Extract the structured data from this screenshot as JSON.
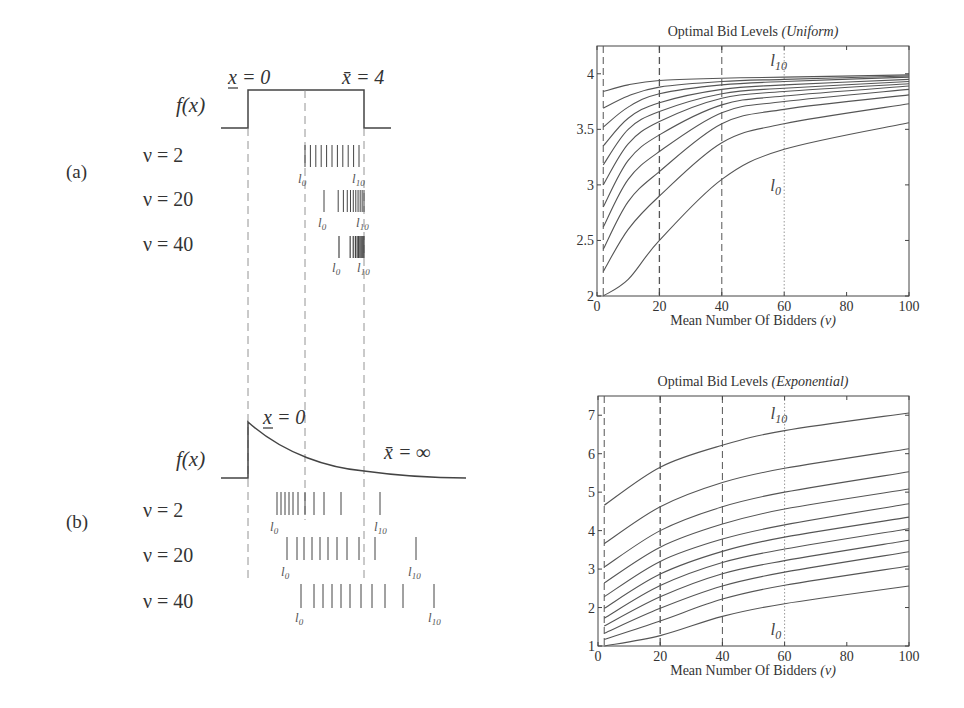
{
  "left_panel": {
    "panel_a": {
      "label": "(a)",
      "f_label": "f(x)",
      "x_low_label": "x = 0",
      "x_high_label": "x̄ = 4",
      "rows": [
        {
          "label": "ν = 2",
          "l0": "l0",
          "l10": "l10"
        },
        {
          "label": "ν = 20",
          "l0": "l0",
          "l10": "l10"
        },
        {
          "label": "ν = 40",
          "l0": "l0",
          "l10": "l10"
        }
      ]
    },
    "panel_b": {
      "label": "(b)",
      "f_label": "f(x)",
      "x_low_label": "x = 0",
      "x_high_label": "x̄ = ∞",
      "rows": [
        {
          "label": "ν = 2",
          "l0": "l0",
          "l10": "l10"
        },
        {
          "label": "ν = 20",
          "l0": "l0",
          "l10": "l10"
        },
        {
          "label": "ν = 40",
          "l0": "l0",
          "l10": "l10"
        }
      ]
    }
  },
  "chart_data": [
    {
      "type": "line",
      "title": "Optimal Bid Levels (Uniform)",
      "title_main": "Optimal Bid Levels",
      "title_italic": "(Uniform)",
      "xlabel": "Mean Number Of Bidders (v)",
      "xlabel_main": "Mean Number Of Bidders",
      "xlabel_italic": "(v)",
      "ylabel": "",
      "xlim": [
        0,
        100
      ],
      "ylim": [
        2,
        4.25
      ],
      "xticks": [
        0,
        20,
        40,
        60,
        80,
        100
      ],
      "yticks": [
        2,
        2.5,
        3,
        3.5,
        4
      ],
      "ytick_labels": [
        "2",
        "2.5",
        "3",
        "3.5",
        "4"
      ],
      "vlines": [
        {
          "x": 2,
          "style": "dashed"
        },
        {
          "x": 20,
          "style": "dashed"
        },
        {
          "x": 40,
          "style": "dashed"
        },
        {
          "x": 60,
          "style": "dotted"
        }
      ],
      "annotations": [
        {
          "text": "l10",
          "x": 60,
          "y": 4.12
        },
        {
          "text": "l0",
          "x": 60,
          "y": 3.0
        }
      ],
      "x": [
        2,
        10,
        20,
        40,
        60,
        100
      ],
      "series": [
        {
          "name": "l0",
          "values": [
            2.0,
            2.15,
            2.5,
            3.05,
            3.32,
            3.56
          ]
        },
        {
          "name": "l1",
          "values": [
            2.22,
            2.6,
            2.9,
            3.38,
            3.55,
            3.73
          ]
        },
        {
          "name": "l2",
          "values": [
            2.42,
            2.85,
            3.12,
            3.55,
            3.68,
            3.81
          ]
        },
        {
          "name": "l3",
          "values": [
            2.62,
            3.05,
            3.3,
            3.65,
            3.75,
            3.86
          ]
        },
        {
          "name": "l4",
          "values": [
            2.8,
            3.22,
            3.45,
            3.72,
            3.8,
            3.89
          ]
        },
        {
          "name": "l5",
          "values": [
            3.0,
            3.37,
            3.57,
            3.78,
            3.84,
            3.91
          ]
        },
        {
          "name": "l6",
          "values": [
            3.18,
            3.5,
            3.66,
            3.82,
            3.87,
            3.93
          ]
        },
        {
          "name": "l7",
          "values": [
            3.35,
            3.6,
            3.74,
            3.86,
            3.9,
            3.95
          ]
        },
        {
          "name": "l8",
          "values": [
            3.52,
            3.7,
            3.82,
            3.9,
            3.93,
            3.97
          ]
        },
        {
          "name": "l9",
          "values": [
            3.69,
            3.8,
            3.88,
            3.93,
            3.95,
            3.98
          ]
        },
        {
          "name": "l10",
          "values": [
            3.84,
            3.9,
            3.94,
            3.96,
            3.97,
            3.99
          ]
        }
      ]
    },
    {
      "type": "line",
      "title": "Optimal Bid Levels (Exponential)",
      "title_main": "Optimal Bid Levels",
      "title_italic": "(Exponential)",
      "xlabel": "Mean Number Of Bidders (v)",
      "xlabel_main": "Mean Number Of Bidders",
      "xlabel_italic": "(v)",
      "ylabel": "",
      "xlim": [
        0,
        100
      ],
      "ylim": [
        1,
        7.5
      ],
      "xticks": [
        0,
        20,
        40,
        60,
        80,
        100
      ],
      "yticks": [
        1,
        2,
        3,
        4,
        5,
        6,
        7
      ],
      "ytick_labels": [
        "1",
        "2",
        "3",
        "4",
        "5",
        "6",
        "7"
      ],
      "vlines": [
        {
          "x": 2,
          "style": "dashed"
        },
        {
          "x": 20,
          "style": "dashed"
        },
        {
          "x": 40,
          "style": "dashed"
        },
        {
          "x": 60,
          "style": "dotted"
        }
      ],
      "annotations": [
        {
          "text": "l10",
          "x": 60,
          "y": 7.05
        },
        {
          "text": "l0",
          "x": 60,
          "y": 1.45
        }
      ],
      "x": [
        2,
        20,
        40,
        60,
        100
      ],
      "series": [
        {
          "name": "l0",
          "values": [
            1.0,
            1.27,
            1.77,
            2.1,
            2.56
          ]
        },
        {
          "name": "l1",
          "values": [
            1.17,
            1.65,
            2.22,
            2.58,
            3.08
          ]
        },
        {
          "name": "l2",
          "values": [
            1.33,
            1.98,
            2.56,
            2.92,
            3.45
          ]
        },
        {
          "name": "l3",
          "values": [
            1.52,
            2.28,
            2.88,
            3.22,
            3.75
          ]
        },
        {
          "name": "l4",
          "values": [
            1.72,
            2.57,
            3.17,
            3.52,
            4.05
          ]
        },
        {
          "name": "l5",
          "values": [
            1.98,
            2.87,
            3.46,
            3.83,
            4.35
          ]
        },
        {
          "name": "l6",
          "values": [
            2.28,
            3.2,
            3.78,
            4.15,
            4.7
          ]
        },
        {
          "name": "l7",
          "values": [
            2.64,
            3.57,
            4.17,
            4.56,
            5.08
          ]
        },
        {
          "name": "l8",
          "values": [
            3.05,
            4.0,
            4.62,
            5.0,
            5.53
          ]
        },
        {
          "name": "l9",
          "values": [
            3.66,
            4.62,
            5.25,
            5.62,
            6.13
          ]
        },
        {
          "name": "l10",
          "values": [
            4.66,
            5.65,
            6.22,
            6.6,
            7.06
          ]
        }
      ]
    }
  ]
}
